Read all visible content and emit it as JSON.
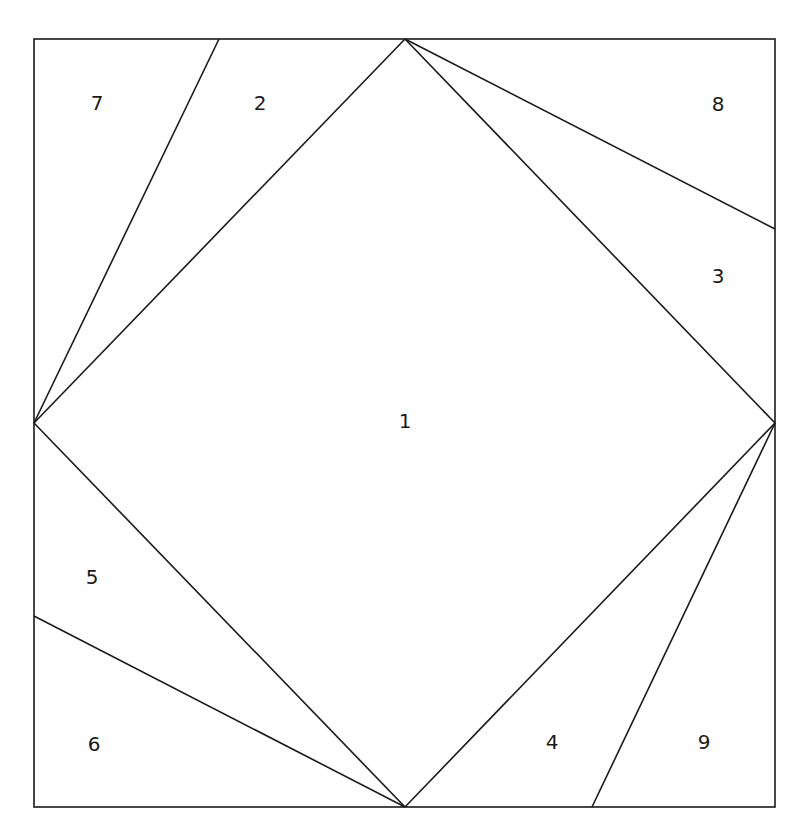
{
  "diagram": {
    "type": "paper-piecing quilt block pattern",
    "stroke_color": "#1a1a1a",
    "background_color": "#ffffff",
    "outer_square": {
      "x1": 34,
      "y1": 39,
      "x2": 775,
      "y2": 807
    },
    "lines": [
      {
        "name": "diamond-top-left-edge",
        "x1": 34,
        "y1": 423,
        "x2": 405,
        "y2": 39
      },
      {
        "name": "diamond-top-right-edge",
        "x1": 405,
        "y1": 39,
        "x2": 775,
        "y2": 423
      },
      {
        "name": "diamond-bottom-right-edge",
        "x1": 775,
        "y1": 423,
        "x2": 405,
        "y2": 807
      },
      {
        "name": "diamond-bottom-left-edge",
        "x1": 405,
        "y1": 807,
        "x2": 34,
        "y2": 423
      },
      {
        "name": "split-line-7-2",
        "x1": 219,
        "y1": 39,
        "x2": 34,
        "y2": 423
      },
      {
        "name": "split-line-8-3",
        "x1": 405,
        "y1": 39,
        "x2": 775,
        "y2": 229
      },
      {
        "name": "split-line-4-9",
        "x1": 592,
        "y1": 807,
        "x2": 775,
        "y2": 423
      },
      {
        "name": "split-line-5-6",
        "x1": 34,
        "y1": 616,
        "x2": 405,
        "y2": 807
      }
    ],
    "labels": [
      {
        "text": "1",
        "x": 405,
        "y": 421
      },
      {
        "text": "2",
        "x": 260,
        "y": 103
      },
      {
        "text": "3",
        "x": 718,
        "y": 276
      },
      {
        "text": "4",
        "x": 552,
        "y": 742
      },
      {
        "text": "5",
        "x": 92,
        "y": 577
      },
      {
        "text": "6",
        "x": 94,
        "y": 744
      },
      {
        "text": "7",
        "x": 97,
        "y": 103
      },
      {
        "text": "8",
        "x": 718,
        "y": 104
      },
      {
        "text": "9",
        "x": 704,
        "y": 742
      }
    ]
  }
}
